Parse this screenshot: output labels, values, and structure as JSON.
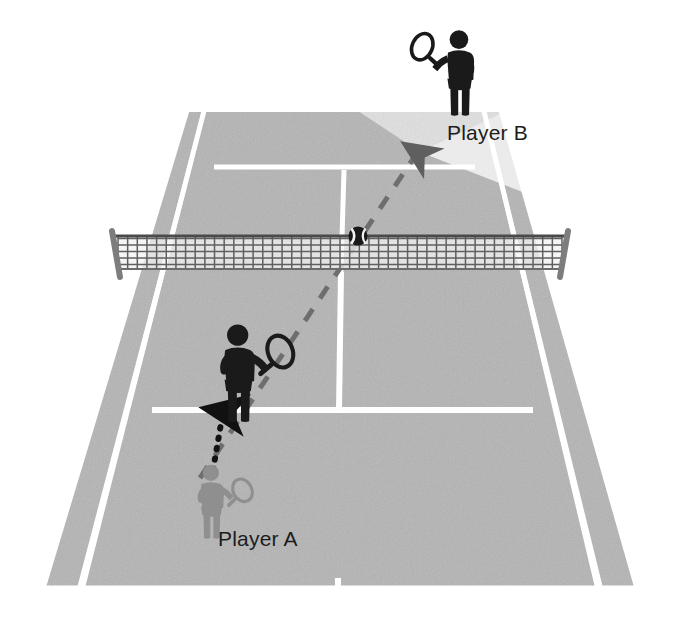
{
  "diagram": {
    "surface_color": "#b4b4b4",
    "line_color": "#ffffff",
    "highlight_color": "#e3e3e3",
    "background_color": "#ffffff",
    "dark_figure_color": "#1a1a1a",
    "light_figure_color": "#8f8f8f",
    "dashed_path_color": "#6e6e6e",
    "dotted_path_color": "#121212",
    "net_color": "#6b6b6b",
    "net_post_color": "#7a7a7a",
    "ball_color": "#1a1a1a"
  },
  "labels": {
    "player_a": "Player A",
    "player_b": "Player B"
  },
  "figures": [
    {
      "id": "player-a-start",
      "name": "player-a-figure",
      "label": "Player A",
      "shade": "light",
      "racket_side": "right",
      "position": {
        "x": 196,
        "y": 463
      },
      "scale": 0.62
    },
    {
      "id": "player-a-moved",
      "name": "player-a-moved-figure",
      "label": "",
      "shade": "dark",
      "racket_side": "right",
      "position": {
        "x": 218,
        "y": 322
      },
      "scale": 0.82
    },
    {
      "id": "player-b",
      "name": "player-b-figure",
      "label": "Player B",
      "shade": "dark",
      "racket_side": "left",
      "position": {
        "x": 428,
        "y": 28
      },
      "scale": 0.72
    }
  ],
  "paths": {
    "ball_flight": {
      "name": "ball-flight-dashed-arrow",
      "style": "dashed",
      "from": {
        "x": 200,
        "y": 470
      },
      "to": {
        "x": 419,
        "y": 150
      },
      "arrowhead": "at-end",
      "description": "dashed arrow showing ball trajectory over the net toward Player B side"
    },
    "player_movement": {
      "name": "player-movement-dotted-arrow",
      "style": "dotted",
      "from": {
        "x": 211,
        "y": 470
      },
      "to": {
        "x": 223,
        "y": 408
      },
      "arrowhead": "at-end",
      "description": "dotted arrow showing Player A moving forward"
    }
  },
  "ball": {
    "name": "tennis-ball",
    "position": {
      "x": 358,
      "y": 236
    },
    "radius": 9
  },
  "net": {
    "name": "tennis-net",
    "left_post": {
      "x": 110,
      "y": 232
    },
    "right_post": {
      "x": 570,
      "y": 232
    },
    "height": 40,
    "mesh_columns": 46,
    "mesh_rows": 5
  },
  "highlight_wedge": {
    "name": "target-zone-highlight",
    "description": "light cone showing the open court area Player B must cover",
    "apex": {
      "x": 420,
      "y": 152
    },
    "color": "#e3e3e3"
  },
  "court_geometry": {
    "near_baseline_y": 592,
    "far_baseline_y": 107,
    "net_y": 272,
    "near_left_x": 42,
    "near_right_x": 638,
    "far_left_x": 188,
    "far_right_x": 500,
    "lines": [
      "far-baseline",
      "near-baseline",
      "left-doubles-sideline",
      "right-doubles-sideline",
      "left-singles-sideline",
      "right-singles-sideline",
      "far-service-line",
      "near-service-line",
      "center-service-line",
      "near-center-mark"
    ]
  }
}
